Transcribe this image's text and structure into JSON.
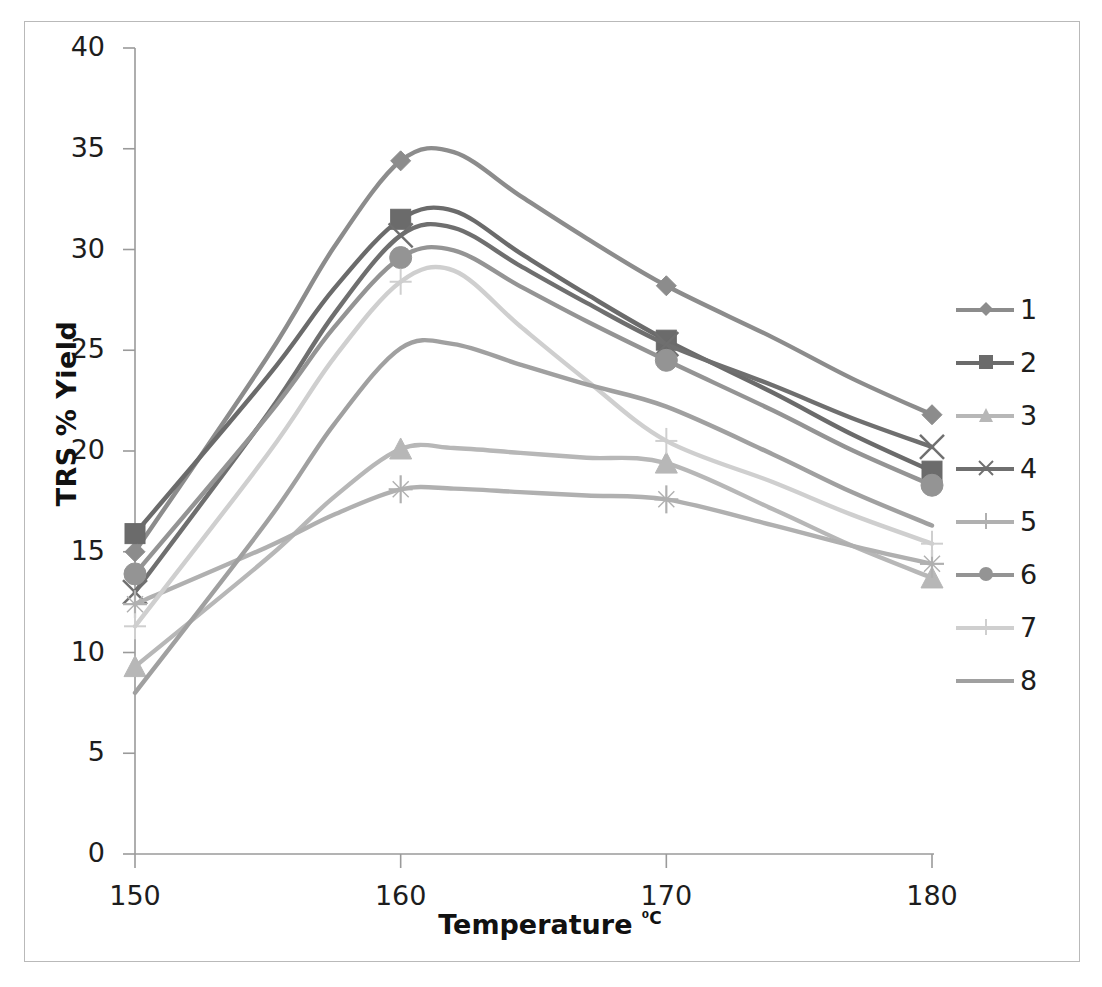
{
  "chart_data": {
    "type": "line",
    "title": "",
    "xlabel": "Temperature ⁰C",
    "ylabel": "TRS % Yield",
    "xlim": [
      145,
      183
    ],
    "ylim": [
      0,
      40
    ],
    "xticks": [
      "150",
      "160",
      "170",
      "180"
    ],
    "xtick_values": [
      150,
      160,
      170,
      180
    ],
    "yticks": [
      "0",
      "5",
      "10",
      "15",
      "20",
      "25",
      "30",
      "35",
      "40"
    ],
    "ytick_values": [
      0,
      5,
      10,
      15,
      20,
      25,
      30,
      35,
      40
    ],
    "grid": false,
    "legend_position": "right",
    "x": [
      150,
      160,
      170,
      180
    ],
    "series": [
      {
        "name": "1",
        "values": [
          15.0,
          34.4,
          28.2,
          21.8
        ],
        "marker": "diamond",
        "color": "#8c8c8c"
      },
      {
        "name": "2",
        "values": [
          15.9,
          31.5,
          25.5,
          19.0
        ],
        "marker": "square",
        "color": "#6b6b6b"
      },
      {
        "name": "3",
        "values": [
          9.3,
          20.1,
          19.4,
          13.7
        ],
        "marker": "triangle",
        "color": "#b7b7b7"
      },
      {
        "name": "4",
        "values": [
          13.0,
          30.7,
          25.3,
          20.2
        ],
        "marker": "cross",
        "color": "#6f6f6f"
      },
      {
        "name": "5",
        "values": [
          12.4,
          18.1,
          17.6,
          14.4
        ],
        "marker": "plus",
        "color": "#b0b0b0"
      },
      {
        "name": "6",
        "values": [
          13.9,
          29.6,
          24.5,
          18.3
        ],
        "marker": "circle",
        "color": "#949494"
      },
      {
        "name": "7",
        "values": [
          11.3,
          28.4,
          20.5,
          15.4
        ],
        "marker": "dash",
        "color": "#cfcfcf"
      },
      {
        "name": "8",
        "values": [
          8.0,
          25.1,
          22.2,
          16.3
        ],
        "marker": "line",
        "color": "#a0a0a0"
      }
    ]
  },
  "axis": {
    "y_title": "TRS % Yield",
    "x_title_main": "Temperature ",
    "x_title_sup": "⁰C"
  },
  "legend": {
    "items": [
      {
        "label": "1"
      },
      {
        "label": "2"
      },
      {
        "label": "3"
      },
      {
        "label": "4"
      },
      {
        "label": "5"
      },
      {
        "label": "6"
      },
      {
        "label": "7"
      },
      {
        "label": "8"
      }
    ]
  }
}
